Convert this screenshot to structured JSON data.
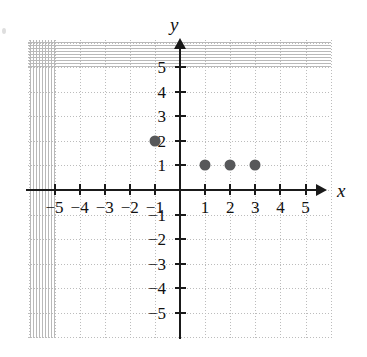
{
  "figure": {
    "axis_label_x": "x",
    "axis_label_y": "y",
    "artifact_name": "scan-artifact"
  },
  "chart_data": {
    "type": "scatter",
    "title": "",
    "subtitle": "",
    "xlabel": "x",
    "ylabel": "y",
    "xlim": [
      -6,
      6
    ],
    "ylim": [
      -6,
      6
    ],
    "grid": true,
    "legend": null,
    "annotations": [],
    "point_color": "#57585a",
    "axis_color": "#1a1a1a",
    "grid_color": "#bcbcbc",
    "x_ticks": [
      -5,
      -4,
      -3,
      -2,
      -1,
      1,
      2,
      3,
      4,
      5
    ],
    "y_ticks": [
      5,
      4,
      3,
      2,
      1,
      -1,
      -2,
      -3,
      -4,
      -5
    ],
    "x_tick_labels": [
      "−5",
      "−4",
      "−3",
      "−2",
      "−1",
      "1",
      "2",
      "3",
      "4",
      "5"
    ],
    "y_tick_labels": [
      "5",
      "4",
      "3",
      "2",
      "1",
      "−1",
      "−2",
      "−3",
      "−4",
      "−5"
    ],
    "points": [
      {
        "x": -1,
        "y": 2,
        "label": "(−1, 2)"
      },
      {
        "x": 1,
        "y": 1,
        "label": "(1, 1)"
      },
      {
        "x": 2,
        "y": 1,
        "label": "(2, 1)"
      },
      {
        "x": 3,
        "y": 1,
        "label": "(3, 1)"
      }
    ]
  }
}
